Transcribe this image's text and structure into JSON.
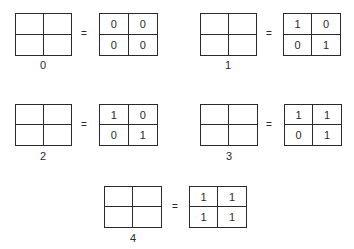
{
  "diagrams": [
    {
      "label": "0",
      "equals": "=",
      "matrix": [
        "0",
        "0",
        "0",
        "0"
      ]
    },
    {
      "label": "1",
      "equals": "=",
      "matrix": [
        "1",
        "0",
        "0",
        "1"
      ]
    },
    {
      "label": "2",
      "equals": "=",
      "matrix": [
        "1",
        "0",
        "0",
        "1"
      ]
    },
    {
      "label": "3",
      "equals": "=",
      "matrix": [
        "1",
        "1",
        "0",
        "1"
      ]
    },
    {
      "label": "4",
      "equals": "=",
      "matrix": [
        "1",
        "1",
        "1",
        "1"
      ]
    }
  ]
}
